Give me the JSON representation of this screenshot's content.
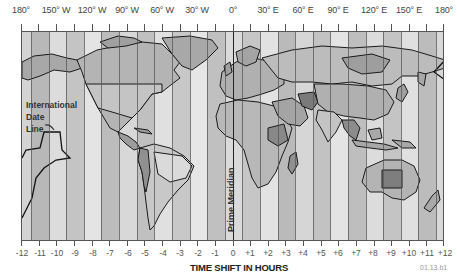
{
  "map": {
    "title": "World Time Zones",
    "longitude_labels": [
      "180°",
      "150° W",
      "120° W",
      "90° W",
      "60° W",
      "30° W",
      "0°",
      "30° E",
      "60° E",
      "90° E",
      "120° E",
      "150° E",
      "180°"
    ],
    "hour_labels": [
      "-12",
      "-11",
      "-10",
      "-9",
      "-8",
      "-7",
      "-6",
      "-5",
      "-4",
      "-3",
      "-2",
      "-1",
      "0",
      "+1",
      "+2",
      "+3",
      "+4",
      "+5",
      "+6",
      "+7",
      "+8",
      "+9",
      "+10",
      "+11",
      "+12"
    ],
    "axis_title": "TIME SHIFT IN HOURS",
    "figure_code": "01.13.b1",
    "annotations": {
      "date_line": [
        "International",
        "Date",
        "Line"
      ],
      "prime_meridian": "Prime Meridian"
    },
    "colors": {
      "frame": "#555555",
      "strip_light": "#e2e2e2",
      "strip_mid": "#c8c8c8",
      "strip_dark": "#b0b0b0",
      "land_light": "#d0d0d0",
      "land_mid": "#a8a8a8",
      "land_dark": "#808080",
      "coast": "#1a1a1a"
    }
  }
}
